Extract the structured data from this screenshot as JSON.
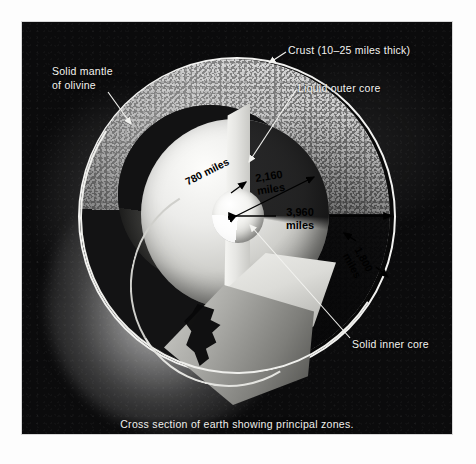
{
  "figure": {
    "caption": "Cross section of earth showing principal zones.",
    "background_color": "#0b0b0c",
    "label_color": "#f3f3f0",
    "measure_label_color": "#000000"
  },
  "labels": {
    "crust": "Crust (10–25 miles thick)",
    "outer_core": "Liquid outer core",
    "mantle": "Solid mantle\nof olivine",
    "inner_core": "Solid inner core"
  },
  "measurements": [
    {
      "id": "inner-core-radius",
      "value": "780 miles",
      "rotation": -27
    },
    {
      "id": "outer-core-radius",
      "value": "2,160\nmiles",
      "rotation": -9
    },
    {
      "id": "earth-radius",
      "value": "3,960\nmiles",
      "rotation": 0
    },
    {
      "id": "mantle-thickness",
      "value": "1,800\nmiles",
      "rotation": 62
    }
  ],
  "measure_text": {
    "m780": "780 miles",
    "m2160": "2,160\nmiles",
    "m3960": "3,960\nmiles",
    "m1800": "1,800\nmiles"
  },
  "zones": [
    {
      "name": "Crust",
      "detail": "10–25 miles thick"
    },
    {
      "name": "Solid mantle of olivine",
      "detail": "1,800 miles"
    },
    {
      "name": "Liquid outer core",
      "detail": "2,160 miles"
    },
    {
      "name": "Solid inner core",
      "detail": "780 miles"
    }
  ]
}
